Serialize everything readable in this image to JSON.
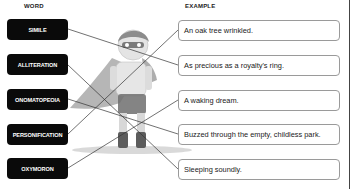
{
  "headers": {
    "word": "WORD",
    "example": "EXAMPLE"
  },
  "words": [
    {
      "label": "SIMILE"
    },
    {
      "label": "ALLITERATION"
    },
    {
      "label": "ONOMATOPEOIA"
    },
    {
      "label": "PERSONIFICATION"
    },
    {
      "label": "OXYMORON"
    }
  ],
  "examples": [
    {
      "text": "An oak tree wrinkled."
    },
    {
      "text": "As precious as a royalty's ring."
    },
    {
      "text": "A waking dream."
    },
    {
      "text": "Buzzed through the empty, childless park."
    },
    {
      "text": "Sleeping soundly."
    }
  ],
  "connections": [
    {
      "word": "SIMILE",
      "example_index": 1
    },
    {
      "word": "ALLITERATION",
      "example_index": 4
    },
    {
      "word": "ONOMATOPEOIA",
      "example_index": 3
    },
    {
      "word": "PERSONIFICATION",
      "example_index": 0
    },
    {
      "word": "OXYMORON",
      "example_index": 2
    }
  ],
  "illustration": "superhero-child-figure",
  "colors": {
    "word_box": "#0a0a0a",
    "example_border": "#9a9a9a",
    "line": "#333333"
  }
}
